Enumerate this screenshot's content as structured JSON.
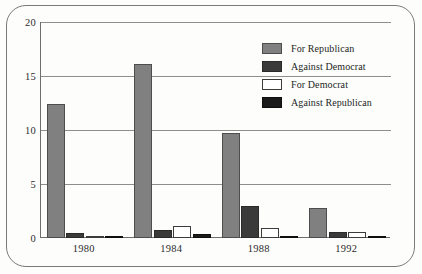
{
  "chart_data": {
    "type": "bar",
    "title": "",
    "subtitle": "",
    "xlabel": "",
    "ylabel": "",
    "categories": [
      "1980",
      "1984",
      "1988",
      "1992"
    ],
    "series": [
      {
        "name": "For Republican",
        "color": "#808080",
        "values": [
          12.4,
          16.1,
          9.7,
          2.8
        ]
      },
      {
        "name": "Against Democrat",
        "color": "#3a3a3a",
        "values": [
          0.5,
          0.75,
          3.0,
          0.6
        ]
      },
      {
        "name": "For Democrat",
        "color": "#ffffff",
        "values": [
          0.1,
          1.1,
          0.9,
          0.6
        ]
      },
      {
        "name": "Against Republican",
        "color": "#1a1a1a",
        "values": [
          0.15,
          0.35,
          0.1,
          0.2
        ]
      }
    ],
    "ylim": [
      0,
      20
    ],
    "yticks": [
      0,
      5,
      10,
      15,
      20
    ],
    "ytick_labels": [
      "0",
      "5",
      "10",
      "15",
      "20"
    ],
    "grid": true,
    "grid_axis": "y",
    "legend_position": "top-right",
    "frame": "rounded-rectangle-border"
  }
}
